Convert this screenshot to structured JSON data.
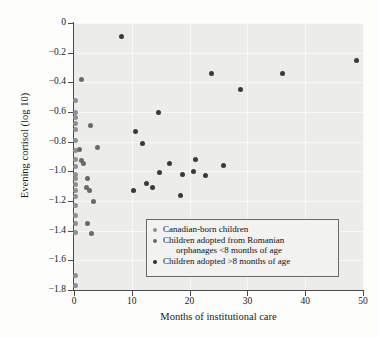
{
  "chart_data": {
    "type": "scatter",
    "title": "",
    "xlabel": "Months of institutional care",
    "ylabel": "Evening cortisol (log 10)",
    "xlim": [
      0,
      50
    ],
    "ylim": [
      -1.8,
      0
    ],
    "xticks": [
      "0",
      "10",
      "20",
      "30",
      "40",
      "50"
    ],
    "xtick_values": [
      0,
      10,
      20,
      30,
      40,
      50
    ],
    "yticks": [
      "0",
      "−0.2",
      "−0.4",
      "−0.6",
      "−0.8",
      "−1.0",
      "−1.2",
      "−1.4",
      "−1.6",
      "−1.8"
    ],
    "ytick_values": [
      0,
      -0.2,
      -0.4,
      -0.6,
      -0.8,
      -1.0,
      -1.2,
      -1.4,
      -1.6,
      -1.8
    ],
    "grid": true,
    "legend_position": "inside-bottom-center",
    "panel_background": "#ececeb",
    "series": [
      {
        "name": "Canadian-born children",
        "color": "#8f8f8f",
        "points": [
          [
            0.3,
            -0.52
          ],
          [
            0.3,
            -0.6
          ],
          [
            0.3,
            -0.64
          ],
          [
            0.3,
            -0.68
          ],
          [
            0.3,
            -0.72
          ],
          [
            0.3,
            -0.79
          ],
          [
            0.3,
            -0.86
          ],
          [
            0.3,
            -0.92
          ],
          [
            0.3,
            -0.97
          ],
          [
            0.3,
            -1.02
          ],
          [
            0.3,
            -1.05
          ],
          [
            0.3,
            -1.09
          ],
          [
            0.3,
            -1.13
          ],
          [
            0.3,
            -1.17
          ],
          [
            0.3,
            -1.23
          ],
          [
            0.3,
            -1.3
          ],
          [
            0.3,
            -1.35
          ],
          [
            0.3,
            -1.41
          ],
          [
            0.3,
            -1.7
          ],
          [
            0.3,
            -1.77
          ]
        ]
      },
      {
        "name": "Children adopted from Romanian orphanages <8 months of age",
        "color": "#6a6a6a",
        "points": [
          [
            1.3,
            -0.38
          ],
          [
            2.9,
            -0.69
          ],
          [
            1.0,
            -0.85
          ],
          [
            4.1,
            -0.84
          ],
          [
            1.3,
            -0.93
          ],
          [
            1.6,
            -0.95
          ],
          [
            2.3,
            -1.05
          ],
          [
            2.2,
            -1.11
          ],
          [
            2.6,
            -1.13
          ],
          [
            3.4,
            -1.2
          ],
          [
            2.3,
            -1.35
          ],
          [
            3.0,
            -1.42
          ]
        ]
      },
      {
        "name": "Children adopted >8 months of age",
        "color": "#3a3a3a",
        "points": [
          [
            8.3,
            -0.09
          ],
          [
            48.8,
            -0.25
          ],
          [
            23.8,
            -0.34
          ],
          [
            36.0,
            -0.34
          ],
          [
            28.8,
            -0.45
          ],
          [
            14.6,
            -0.6
          ],
          [
            10.6,
            -0.73
          ],
          [
            11.8,
            -0.81
          ],
          [
            21.1,
            -0.92
          ],
          [
            16.6,
            -0.95
          ],
          [
            25.8,
            -0.96
          ],
          [
            20.6,
            -1.0
          ],
          [
            14.8,
            -1.01
          ],
          [
            18.7,
            -1.02
          ],
          [
            22.8,
            -1.03
          ],
          [
            12.5,
            -1.08
          ],
          [
            13.5,
            -1.11
          ],
          [
            10.3,
            -1.13
          ],
          [
            18.4,
            -1.16
          ]
        ]
      }
    ]
  },
  "legend": {
    "entries": [
      {
        "label": "Canadian-born children",
        "label2": ""
      },
      {
        "label": "Children adopted from Romanian",
        "label2": "orphanages <8 months of age"
      },
      {
        "label": "Children adopted >8 months of age",
        "label2": ""
      }
    ]
  }
}
